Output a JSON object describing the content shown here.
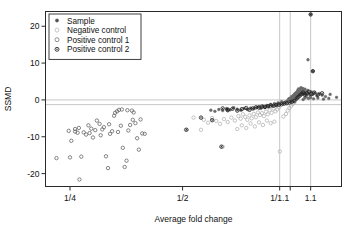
{
  "chart_data": {
    "type": "scatter",
    "title": "",
    "xlabel": "Average fold change",
    "ylabel": "SSMD",
    "xscale": "log",
    "x_tick_labels": [
      "1/4",
      "1/2",
      "1/1.1",
      "1.1"
    ],
    "x_tick_values": [
      0.25,
      0.5,
      0.909,
      1.1
    ],
    "y_tick_labels": [
      "20",
      "10",
      "0",
      "-10",
      "-20"
    ],
    "y_tick_values": [
      20,
      10,
      0,
      -10,
      -20
    ],
    "xlim": [
      0.215,
      1.33
    ],
    "ylim": [
      -23.5,
      24.0
    ],
    "grid": false,
    "reference_lines": {
      "horizontal": [
        0,
        -1.28
      ],
      "vertical": [
        0.909,
        0.97,
        1.1
      ],
      "color": "#bfbfbf"
    },
    "legend": {
      "position": "top-left",
      "entries": [
        {
          "label": "Sample",
          "marker": "filled-dot",
          "color": "#555555"
        },
        {
          "label": "Negative control",
          "marker": "open-circle",
          "color": "#b4b4b4"
        },
        {
          "label": "Positive control 1",
          "marker": "open-circle",
          "color": "#707070"
        },
        {
          "label": "Positive control 2",
          "marker": "circle-dot",
          "color": "#222222"
        }
      ]
    },
    "series": [
      {
        "name": "Sample",
        "marker": "filled-dot",
        "color": "#6a6a6a",
        "points": [
          [
            0.96,
            0.2
          ],
          [
            0.965,
            0.4
          ],
          [
            0.97,
            0.1
          ],
          [
            0.972,
            -0.2
          ],
          [
            0.975,
            0.5
          ],
          [
            0.978,
            0.9
          ],
          [
            0.98,
            0.3
          ],
          [
            0.982,
            -0.4
          ],
          [
            0.985,
            0.7
          ],
          [
            0.987,
            1.1
          ],
          [
            0.988,
            0.0
          ],
          [
            0.99,
            0.6
          ],
          [
            0.992,
            1.3
          ],
          [
            0.993,
            -0.3
          ],
          [
            0.995,
            0.8
          ],
          [
            0.996,
            1.6
          ],
          [
            0.998,
            0.4
          ],
          [
            1.0,
            1.0
          ],
          [
            1.002,
            1.8
          ],
          [
            1.004,
            0.2
          ],
          [
            1.005,
            1.4
          ],
          [
            1.007,
            2.0
          ],
          [
            1.009,
            0.9
          ],
          [
            1.011,
            1.7
          ],
          [
            1.013,
            2.3
          ],
          [
            1.015,
            1.2
          ],
          [
            1.017,
            2.6
          ],
          [
            1.019,
            1.9
          ],
          [
            1.021,
            3.0
          ],
          [
            1.024,
            2.2
          ],
          [
            1.027,
            1.5
          ],
          [
            1.03,
            2.8
          ],
          [
            1.033,
            2.0
          ],
          [
            1.036,
            3.3
          ],
          [
            1.04,
            2.5
          ],
          [
            1.044,
            1.9
          ],
          [
            1.048,
            3.1
          ],
          [
            1.052,
            2.4
          ],
          [
            1.057,
            1.6
          ],
          [
            1.062,
            2.9
          ],
          [
            1.067,
            2.1
          ],
          [
            1.073,
            1.4
          ],
          [
            1.08,
            2.6
          ],
          [
            1.088,
            1.8
          ],
          [
            1.096,
            1.2
          ],
          [
            1.105,
            2.2
          ],
          [
            1.115,
            1.5
          ],
          [
            1.128,
            1.9
          ],
          [
            1.143,
            1.1
          ],
          [
            1.16,
            1.7
          ],
          [
            1.18,
            1.3
          ],
          [
            1.205,
            0.9
          ],
          [
            1.24,
            1.5
          ],
          [
            1.29,
            0.7
          ],
          [
            0.95,
            -0.3
          ],
          [
            0.94,
            -0.6
          ],
          [
            0.93,
            -0.9
          ],
          [
            0.92,
            -0.5
          ],
          [
            0.91,
            -1.1
          ],
          [
            0.9,
            -0.8
          ],
          [
            0.89,
            -1.4
          ],
          [
            0.88,
            -1.0
          ],
          [
            0.87,
            -1.6
          ],
          [
            0.86,
            -1.2
          ],
          [
            0.85,
            -1.9
          ],
          [
            0.84,
            -1.5
          ],
          [
            0.83,
            -2.1
          ],
          [
            0.82,
            -1.7
          ],
          [
            0.81,
            -2.3
          ],
          [
            0.8,
            -1.8
          ],
          [
            0.79,
            -2.0
          ],
          [
            0.775,
            -2.4
          ],
          [
            0.76,
            -2.2
          ],
          [
            0.745,
            -2.6
          ],
          [
            0.73,
            -2.3
          ],
          [
            0.715,
            -2.8
          ],
          [
            0.7,
            -2.5
          ],
          [
            0.685,
            -2.1
          ],
          [
            0.67,
            -2.7
          ],
          [
            0.655,
            -2.4
          ],
          [
            0.64,
            -2.9
          ],
          [
            0.625,
            -2.6
          ],
          [
            0.61,
            -3.1
          ],
          [
            0.595,
            -2.8
          ],
          [
            1.05,
            0.1
          ],
          [
            1.06,
            0.5
          ],
          [
            1.07,
            0.8
          ],
          [
            1.085,
            0.4
          ],
          [
            1.1,
            0.6
          ],
          [
            1.12,
            0.3
          ],
          [
            1.15,
            0.5
          ],
          [
            1.19,
            0.2
          ],
          [
            1.23,
            0.4
          ],
          [
            1.1,
            23.2
          ],
          [
            1.115,
            7.8
          ],
          [
            1.082,
            10.9
          ]
        ]
      },
      {
        "name": "Negative control",
        "marker": "open-circle",
        "color": "#b0b0b0",
        "points": [
          [
            0.905,
            -2.0
          ],
          [
            0.895,
            -2.6
          ],
          [
            0.885,
            -3.1
          ],
          [
            0.875,
            -2.3
          ],
          [
            0.865,
            -3.5
          ],
          [
            0.855,
            -2.8
          ],
          [
            0.845,
            -3.9
          ],
          [
            0.835,
            -3.2
          ],
          [
            0.825,
            -4.4
          ],
          [
            0.815,
            -3.6
          ],
          [
            0.805,
            -4.1
          ],
          [
            0.795,
            -3.4
          ],
          [
            0.785,
            -4.7
          ],
          [
            0.775,
            -3.8
          ],
          [
            0.765,
            -5.0
          ],
          [
            0.755,
            -4.2
          ],
          [
            0.745,
            -5.4
          ],
          [
            0.735,
            -4.6
          ],
          [
            0.725,
            -3.9
          ],
          [
            0.715,
            -5.1
          ],
          [
            0.705,
            -4.4
          ],
          [
            0.69,
            -5.6
          ],
          [
            0.675,
            -4.8
          ],
          [
            0.66,
            -6.0
          ],
          [
            0.645,
            -5.2
          ],
          [
            0.63,
            -6.5
          ],
          [
            0.615,
            -5.7
          ],
          [
            0.6,
            -4.9
          ],
          [
            0.585,
            -6.2
          ],
          [
            0.57,
            -5.4
          ],
          [
            0.88,
            -5.9
          ],
          [
            0.86,
            -6.3
          ],
          [
            0.84,
            -5.6
          ],
          [
            0.82,
            -6.8
          ],
          [
            0.8,
            -6.1
          ],
          [
            0.78,
            -7.2
          ],
          [
            0.76,
            -6.4
          ],
          [
            0.74,
            -7.6
          ],
          [
            0.72,
            -6.9
          ],
          [
            0.7,
            -7.9
          ],
          [
            0.91,
            -14.0
          ],
          [
            0.64,
            -12.7
          ],
          [
            0.56,
            -8.1
          ],
          [
            0.93,
            -4.5
          ],
          [
            0.945,
            -3.8
          ],
          [
            0.955,
            -2.9
          ],
          [
            0.965,
            -2.2
          ],
          [
            0.975,
            -1.6
          ],
          [
            0.985,
            -1.1
          ],
          [
            0.995,
            -0.7
          ],
          [
            0.535,
            -4.8
          ],
          [
            0.51,
            -8.1
          ]
        ]
      },
      {
        "name": "Positive control 1",
        "marker": "open-circle",
        "color": "#5e5e5e",
        "points": [
          [
            0.25,
            -15.6
          ],
          [
            0.252,
            -11.1
          ],
          [
            0.258,
            -8.6
          ],
          [
            0.262,
            -8.9
          ],
          [
            0.264,
            -7.6
          ],
          [
            0.268,
            -15.4
          ],
          [
            0.276,
            -9.4
          ],
          [
            0.282,
            -9.0
          ],
          [
            0.288,
            -10.2
          ],
          [
            0.292,
            -8.2
          ],
          [
            0.295,
            -5.6
          ],
          [
            0.3,
            -6.5
          ],
          [
            0.305,
            -8.0
          ],
          [
            0.308,
            -7.4
          ],
          [
            0.312,
            -15.3
          ],
          [
            0.316,
            -18.5
          ],
          [
            0.32,
            -9.2
          ],
          [
            0.324,
            -8.5
          ],
          [
            0.328,
            -4.3
          ],
          [
            0.33,
            -3.5
          ],
          [
            0.334,
            -3.1
          ],
          [
            0.338,
            -2.7
          ],
          [
            0.342,
            -7.0
          ],
          [
            0.346,
            -13.0
          ],
          [
            0.35,
            -18.2
          ],
          [
            0.354,
            -16.5
          ],
          [
            0.358,
            -8.3
          ],
          [
            0.362,
            -6.8
          ],
          [
            0.366,
            -2.9
          ],
          [
            0.37,
            -3.4
          ],
          [
            0.374,
            -6.3
          ],
          [
            0.378,
            -10.4
          ],
          [
            0.382,
            -13.5
          ],
          [
            0.386,
            -5.3
          ],
          [
            0.39,
            -9.1
          ],
          [
            0.265,
            -21.6
          ],
          [
            0.272,
            -8.8
          ],
          [
            0.285,
            -7.8
          ],
          [
            0.302,
            -9.6
          ],
          [
            0.318,
            -6.6
          ],
          [
            0.336,
            -8.7
          ],
          [
            0.344,
            -2.6
          ],
          [
            0.356,
            -2.8
          ],
          [
            0.368,
            -5.4
          ],
          [
            0.396,
            -9.2
          ],
          [
            0.23,
            -15.8
          ],
          [
            0.248,
            -8.4
          ],
          [
            0.258,
            -7.9
          ],
          [
            0.28,
            -6.9
          ]
        ]
      },
      {
        "name": "Positive control 2",
        "marker": "circle-dot",
        "color": "#1f1f1f",
        "points": [
          [
            0.56,
            -4.8
          ],
          [
            0.6,
            -5.5
          ],
          [
            0.64,
            -2.3
          ],
          [
            0.66,
            -2.6
          ],
          [
            0.68,
            -2.4
          ],
          [
            0.7,
            -2.9
          ],
          [
            0.72,
            -2.5
          ],
          [
            0.74,
            -2.2
          ],
          [
            0.755,
            -2.7
          ],
          [
            0.77,
            -2.3
          ],
          [
            0.785,
            -2.0
          ],
          [
            0.8,
            -2.1
          ],
          [
            0.815,
            -1.8
          ],
          [
            0.83,
            -1.9
          ],
          [
            0.845,
            -1.7
          ],
          [
            0.86,
            -1.5
          ],
          [
            0.875,
            -1.6
          ],
          [
            0.89,
            -1.4
          ],
          [
            0.905,
            -1.3
          ],
          [
            0.92,
            -1.2
          ],
          [
            0.935,
            -1.0
          ],
          [
            0.95,
            -0.9
          ],
          [
            0.965,
            -0.7
          ],
          [
            0.98,
            -0.5
          ],
          [
            0.995,
            -0.3
          ],
          [
            1.01,
            0.4
          ],
          [
            1.02,
            0.8
          ],
          [
            1.03,
            1.2
          ],
          [
            1.04,
            1.6
          ],
          [
            1.05,
            2.0
          ],
          [
            1.06,
            1.4
          ],
          [
            1.075,
            1.8
          ],
          [
            1.09,
            2.2
          ],
          [
            1.105,
            1.6
          ],
          [
            1.125,
            2.0
          ],
          [
            1.15,
            1.4
          ],
          [
            1.18,
            1.8
          ],
          [
            1.1,
            23.2
          ],
          [
            1.115,
            7.8
          ],
          [
            0.512,
            -8.1
          ],
          [
            0.635,
            -12.7
          ],
          [
            0.66,
            -2.8
          ]
        ]
      }
    ]
  },
  "axes": {
    "y_label": "SSMD",
    "x_label": "Average fold change"
  }
}
